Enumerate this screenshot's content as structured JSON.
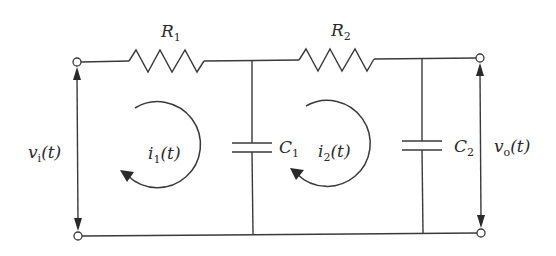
{
  "diagram": {
    "type": "two-stage RC low-pass ladder circuit",
    "components": {
      "R1": {
        "symbol": "R",
        "sub": "1",
        "kind": "resistor"
      },
      "R2": {
        "symbol": "R",
        "sub": "2",
        "kind": "resistor"
      },
      "C1": {
        "symbol": "C",
        "sub": "1",
        "kind": "capacitor"
      },
      "C2": {
        "symbol": "C",
        "sub": "2",
        "kind": "capacitor"
      }
    },
    "currents": {
      "i1": {
        "symbol": "i",
        "sub": "1",
        "arg": "(t)",
        "direction": "clockwise"
      },
      "i2": {
        "symbol": "i",
        "sub": "2",
        "arg": "(t)",
        "direction": "clockwise"
      }
    },
    "voltages": {
      "vi": {
        "symbol": "v",
        "sub": "i",
        "arg": "(t)",
        "side": "input"
      },
      "vo": {
        "symbol": "v",
        "sub": "o",
        "arg": "(t)",
        "side": "output"
      }
    },
    "colors": {
      "line": "#3a3a3a",
      "text": "#2a2a2a",
      "background": "#ffffff"
    }
  }
}
